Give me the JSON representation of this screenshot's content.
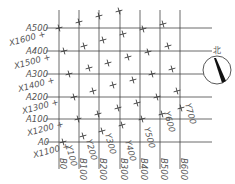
{
  "colors": {
    "line": "#444444",
    "text": "#555555",
    "mark": "#333333"
  },
  "grid": {
    "vertical_x": [
      59,
      79,
      99,
      120,
      140,
      160,
      180
    ],
    "horizontal_y": [
      28,
      51,
      74,
      97,
      119,
      142
    ],
    "x_range": [
      46,
      212
    ],
    "y_range": [
      10,
      157
    ]
  },
  "a_labels": [
    {
      "text": "A500",
      "x": 26,
      "y": 31
    },
    {
      "text": "A400",
      "x": 26,
      "y": 54
    },
    {
      "text": "A300",
      "x": 26,
      "y": 77
    },
    {
      "text": "A200",
      "x": 26,
      "y": 100
    },
    {
      "text": "A100",
      "x": 26,
      "y": 122
    },
    {
      "text": "A0",
      "x": 38,
      "y": 145
    }
  ],
  "x_labels": [
    {
      "text": "X1600 +",
      "x": 10,
      "y": 46
    },
    {
      "text": "X1500 +",
      "x": 15,
      "y": 69
    },
    {
      "text": "X1400 +",
      "x": 19,
      "y": 92
    },
    {
      "text": "X1300 +",
      "x": 23,
      "y": 114
    },
    {
      "text": "X1200 +",
      "x": 28,
      "y": 136
    },
    {
      "text": "X1100 +",
      "x": 34,
      "y": 158
    }
  ],
  "b_labels": [
    {
      "text": "B0",
      "x": 57
    },
    {
      "text": "B100",
      "x": 77
    },
    {
      "text": "B200",
      "x": 97
    },
    {
      "text": "B300",
      "x": 118
    },
    {
      "text": "B400",
      "x": 138
    },
    {
      "text": "B500",
      "x": 158
    },
    {
      "text": "B600",
      "x": 178
    }
  ],
  "y_labels": [
    {
      "text": "Y100",
      "x": 66,
      "y": 146
    },
    {
      "text": "Y200",
      "x": 86,
      "y": 140
    },
    {
      "text": "Y300",
      "x": 105,
      "y": 134
    },
    {
      "text": "Y400",
      "x": 125,
      "y": 141
    },
    {
      "text": "Y500",
      "x": 144,
      "y": 128
    },
    {
      "text": "Y600",
      "x": 164,
      "y": 112
    },
    {
      "text": "Y700",
      "x": 185,
      "y": 104
    }
  ],
  "marks": [
    [
      59,
      28
    ],
    [
      79,
      22
    ],
    [
      99,
      16
    ],
    [
      119,
      11
    ],
    [
      64,
      51
    ],
    [
      84,
      46
    ],
    [
      103,
      40
    ],
    [
      123,
      34
    ],
    [
      143,
      29
    ],
    [
      163,
      24
    ],
    [
      69,
      74
    ],
    [
      89,
      68
    ],
    [
      108,
      63
    ],
    [
      128,
      57
    ],
    [
      148,
      52
    ],
    [
      168,
      46
    ],
    [
      74,
      97
    ],
    [
      93,
      91
    ],
    [
      113,
      85
    ],
    [
      133,
      80
    ],
    [
      152,
      74
    ],
    [
      172,
      69
    ],
    [
      78,
      119
    ],
    [
      98,
      114
    ],
    [
      118,
      108
    ],
    [
      137,
      103
    ],
    [
      157,
      97
    ],
    [
      177,
      91
    ],
    [
      63,
      142
    ],
    [
      83,
      136
    ],
    [
      102,
      131
    ],
    [
      122,
      125
    ],
    [
      142,
      119
    ],
    [
      162,
      114
    ],
    [
      181,
      108
    ]
  ],
  "north_arrow": {
    "label": "北",
    "cx": 217,
    "cy": 70,
    "r": 14
  }
}
